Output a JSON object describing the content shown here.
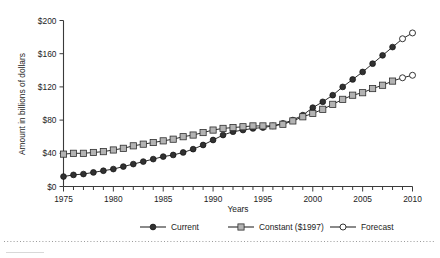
{
  "chart_data": {
    "type": "line",
    "title": "",
    "xlabel": "Years",
    "ylabel": "Amount in billions of dollars",
    "xlim": [
      1975,
      2010
    ],
    "ylim": [
      0,
      200
    ],
    "grid": false,
    "legend_position": "bottom",
    "y_ticks": [
      0,
      40,
      80,
      120,
      160,
      200
    ],
    "y_tick_labels": [
      "$0",
      "$40",
      "$80",
      "$120",
      "$160",
      "$200"
    ],
    "x_ticks": [
      1975,
      1980,
      1985,
      1990,
      1995,
      2000,
      2005,
      2010
    ],
    "x_tick_labels": [
      "1975",
      "1980",
      "1985",
      "1990",
      "1995",
      "2000",
      "2005",
      "2010"
    ],
    "x_minor_tick_interval": 1,
    "x": [
      1975,
      1976,
      1977,
      1978,
      1979,
      1980,
      1981,
      1982,
      1983,
      1984,
      1985,
      1986,
      1987,
      1988,
      1989,
      1990,
      1991,
      1992,
      1993,
      1994,
      1995,
      1996,
      1997,
      1998,
      1999,
      2000,
      2001,
      2002,
      2003,
      2004,
      2005,
      2006,
      2007,
      2008,
      2009,
      2010
    ],
    "series": [
      {
        "name": "Current",
        "marker": "filled-circle",
        "color": "#313131",
        "values": [
          12,
          14,
          15,
          17,
          19,
          21,
          24,
          27,
          30,
          33,
          36,
          38,
          41,
          45,
          50,
          56,
          62,
          66,
          68,
          70,
          71,
          73,
          76,
          80,
          86,
          95,
          102,
          110,
          120,
          129,
          138,
          148,
          158,
          168,
          178,
          185
        ],
        "forecast_from": 2009
      },
      {
        "name": "Constant ($1997)",
        "marker": "filled-square",
        "color": "#b3b3b3",
        "values": [
          39,
          40,
          40,
          41,
          42,
          44,
          46,
          49,
          51,
          53,
          55,
          57,
          60,
          62,
          65,
          68,
          70,
          71,
          72,
          73,
          73,
          73,
          75,
          79,
          84,
          88,
          93,
          99,
          105,
          110,
          113,
          118,
          122,
          127,
          131,
          134
        ],
        "forecast_from": 2009
      }
    ],
    "legend": [
      {
        "label": "Current",
        "marker": "filled-circle"
      },
      {
        "label": "Constant ($1997)",
        "marker": "filled-square"
      },
      {
        "label": "Forecast",
        "marker": "open-circle"
      }
    ]
  }
}
